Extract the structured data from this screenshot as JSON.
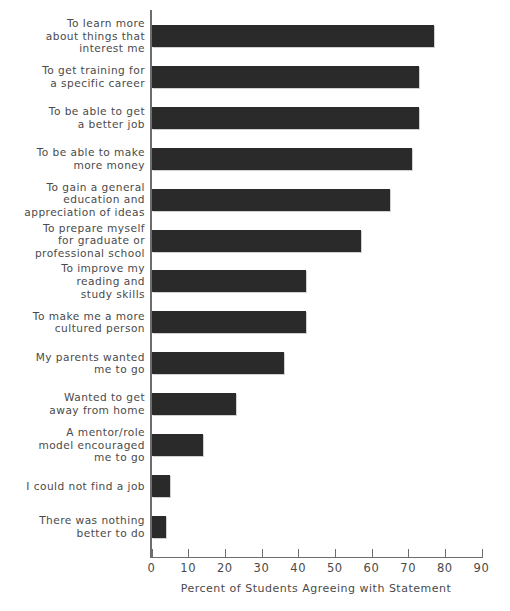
{
  "chart_data": {
    "type": "bar",
    "orientation": "horizontal",
    "title": "",
    "xlabel": "Percent of Students Agreeing with Statement",
    "ylabel": "",
    "xlim": [
      0,
      90
    ],
    "xticks": [
      0,
      10,
      20,
      30,
      40,
      50,
      60,
      70,
      80,
      90
    ],
    "grid": false,
    "legend": null,
    "bar_color": "#2a2a2a",
    "axis_color": "#6d6d6d",
    "text_color": "#4a4a4a",
    "categories": [
      "To learn more\nabout things that\ninterest me",
      "To get training for\na specific career",
      "To be able to get\na better job",
      "To be able to make\nmore money",
      "To gain a general\neducation and\nappreciation of ideas",
      "To prepare myself\nfor graduate or\nprofessional school",
      "To improve my\nreading and\nstudy skills",
      "To make me a more\ncultured person",
      "My parents wanted\nme to go",
      "Wanted to get\naway from home",
      "A mentor/role\nmodel encouraged\nme to go",
      "I could not find a job",
      "There was nothing\nbetter to do"
    ],
    "values": [
      77,
      73,
      73,
      71,
      65,
      57,
      42,
      42,
      36,
      23,
      14,
      5,
      4
    ]
  }
}
